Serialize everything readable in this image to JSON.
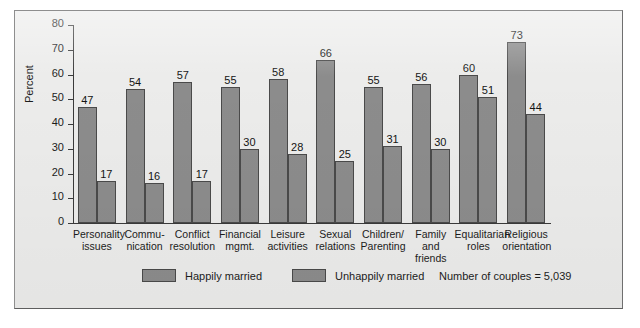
{
  "chart_data": {
    "type": "bar",
    "title": "",
    "xlabel": "",
    "ylabel": "Percent",
    "ylim": [
      0,
      80
    ],
    "yticks": [
      0,
      10,
      20,
      30,
      40,
      50,
      60,
      70,
      80
    ],
    "grid": false,
    "legend_position": "bottom",
    "categories": [
      "Personality\nissues",
      "Commu-\nnication",
      "Conflict\nresolution",
      "Financial\nmgmt.",
      "Leisure\nactivities",
      "Sexual\nrelations",
      "Children/\nParenting",
      "Family\nand friends",
      "Equalitarian\nroles",
      "Religious\norientation"
    ],
    "series": [
      {
        "name": "Happily married",
        "color": "#8c8c8c",
        "values": [
          47,
          54,
          57,
          55,
          58,
          66,
          55,
          56,
          60,
          73
        ]
      },
      {
        "name": "Unhappily married",
        "color": "#8c8c8c",
        "values": [
          17,
          16,
          17,
          30,
          28,
          25,
          31,
          30,
          51,
          44
        ]
      }
    ],
    "annotation": "Number of couples = 5,039"
  },
  "legend": {
    "items": [
      {
        "label": "Happily married"
      },
      {
        "label": "Unhappily married"
      }
    ],
    "note": "Number of couples = 5,039"
  }
}
